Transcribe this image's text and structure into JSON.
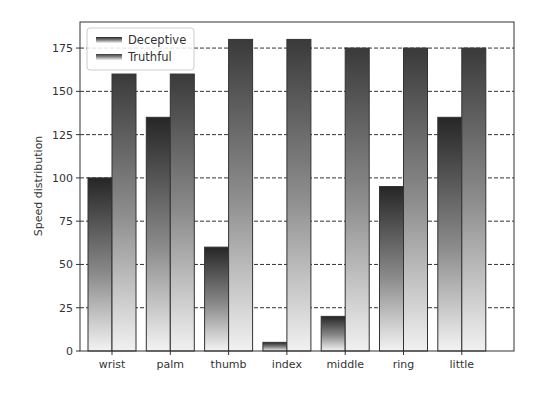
{
  "chart_data": {
    "type": "bar",
    "title": "",
    "xlabel": "",
    "ylabel": "Speed distribution",
    "categories": [
      "wrist",
      "palm",
      "thumb",
      "index",
      "middle",
      "ring",
      "little"
    ],
    "series": [
      {
        "name": "Deceptive",
        "values": [
          100,
          135,
          60,
          5,
          20,
          95,
          135
        ]
      },
      {
        "name": "Truthful",
        "values": [
          160,
          160,
          180,
          180,
          175,
          175,
          175
        ]
      }
    ],
    "ylim": [
      0,
      187
    ],
    "yticks": [
      0,
      25,
      50,
      75,
      100,
      125,
      150,
      175
    ],
    "grid": {
      "y": true,
      "style": "dashed"
    },
    "legend_position": "upper left",
    "colors": {
      "deceptive_top": "#2a2a2a",
      "deceptive_bottom": "#f2f2f2",
      "truthful_top": "#3c3c3c",
      "truthful_bottom": "#f0f0f0",
      "edge": "#333333"
    }
  }
}
